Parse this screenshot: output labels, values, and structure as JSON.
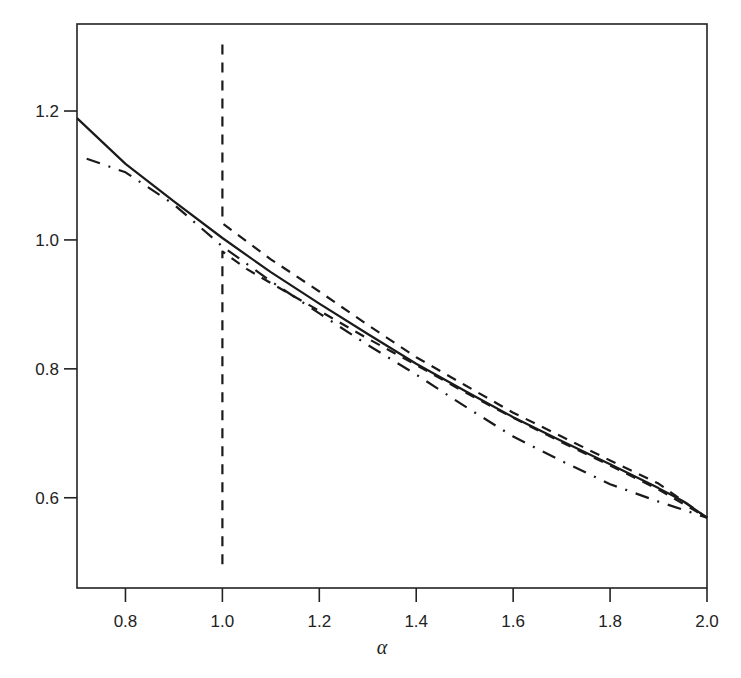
{
  "chart_data": {
    "type": "line",
    "title": "",
    "xlabel": "α",
    "ylabel": "",
    "xlim": [
      0.7,
      2.0
    ],
    "ylim": [
      0.46,
      1.335
    ],
    "xticks": [
      0.8,
      1.0,
      1.2,
      1.4,
      1.6,
      1.8,
      2.0
    ],
    "xtick_labels": [
      "0.8",
      "1.0",
      "1.2",
      "1.4",
      "1.6",
      "1.8",
      "2.0"
    ],
    "yticks": [
      0.6,
      0.8,
      1.0,
      1.2
    ],
    "ytick_labels": [
      "0.6",
      "0.8",
      "1.0",
      "1.2"
    ],
    "grid": false,
    "legend": null,
    "series": [
      {
        "name": "solid",
        "style": "solid",
        "x": [
          0.7,
          0.8,
          0.9,
          1.0,
          1.1,
          1.2,
          1.3,
          1.4,
          1.5,
          1.6,
          1.7,
          1.8,
          1.9,
          1.95,
          2.0
        ],
        "y": [
          1.189,
          1.118,
          1.06,
          1.003,
          0.95,
          0.901,
          0.854,
          0.808,
          0.766,
          0.725,
          0.688,
          0.652,
          0.615,
          0.595,
          0.569
        ]
      },
      {
        "name": "dash-dot",
        "style": "dashdot",
        "x": [
          0.72,
          0.8,
          0.9,
          1.0,
          1.1,
          1.2,
          1.3,
          1.4,
          1.5,
          1.6,
          1.7,
          1.8,
          1.9,
          2.0
        ],
        "y": [
          1.126,
          1.105,
          1.055,
          0.99,
          0.936,
          0.886,
          0.837,
          0.791,
          0.742,
          0.695,
          0.657,
          0.621,
          0.594,
          0.569
        ]
      },
      {
        "name": "dashed-upper",
        "style": "dashed",
        "x": [
          1.0,
          1.0,
          1.1,
          1.2,
          1.3,
          1.4,
          1.5,
          1.6,
          1.7,
          1.8,
          1.9,
          2.0
        ],
        "y": [
          1.303,
          1.026,
          0.97,
          0.92,
          0.868,
          0.818,
          0.775,
          0.732,
          0.695,
          0.658,
          0.622,
          0.569
        ]
      },
      {
        "name": "dashed-lower",
        "style": "dashed",
        "x": [
          1.0,
          1.0,
          1.05,
          1.1,
          1.2,
          1.3,
          1.4,
          1.5,
          1.6,
          1.7,
          1.8,
          1.9,
          2.0
        ],
        "y": [
          0.497,
          0.982,
          0.955,
          0.933,
          0.89,
          0.847,
          0.806,
          0.764,
          0.724,
          0.686,
          0.65,
          0.613,
          0.569
        ]
      }
    ]
  }
}
